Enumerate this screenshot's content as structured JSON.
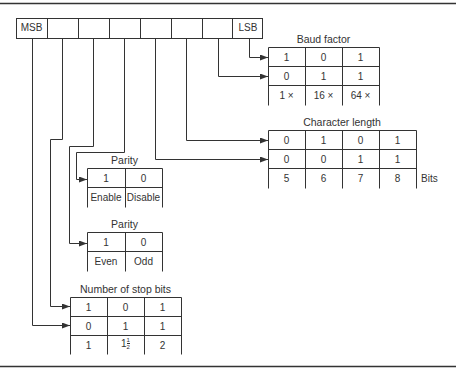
{
  "register": {
    "msb_label": "MSB",
    "lsb_label": "LSB",
    "bit_count": 8
  },
  "tables": {
    "baud_factor": {
      "title": "Baud factor",
      "rows": [
        [
          "1",
          "0",
          "1"
        ],
        [
          "0",
          "1",
          "1"
        ]
      ],
      "labels": [
        "1 ×",
        "16 ×",
        "64 ×"
      ]
    },
    "character_length": {
      "title": "Character length",
      "rows": [
        [
          "0",
          "1",
          "0",
          "1"
        ],
        [
          "0",
          "0",
          "1",
          "1"
        ]
      ],
      "labels": [
        "5",
        "6",
        "7",
        "8"
      ],
      "unit": "Bits"
    },
    "parity_enable": {
      "title": "Parity",
      "rows": [
        [
          "1",
          "0"
        ]
      ],
      "labels": [
        "Enable",
        "Disable"
      ]
    },
    "parity_type": {
      "title": "Parity",
      "rows": [
        [
          "1",
          "0"
        ]
      ],
      "labels": [
        "Even",
        "Odd"
      ]
    },
    "stop_bits": {
      "title": "Number of stop bits",
      "rows": [
        [
          "1",
          "0",
          "1"
        ],
        [
          "0",
          "1",
          "1"
        ]
      ],
      "labels": [
        "1",
        "1",
        "2"
      ],
      "fraction": {
        "num": "1",
        "den": "2"
      }
    }
  },
  "colors": {
    "line": "#333333",
    "background": "#ffffff"
  }
}
